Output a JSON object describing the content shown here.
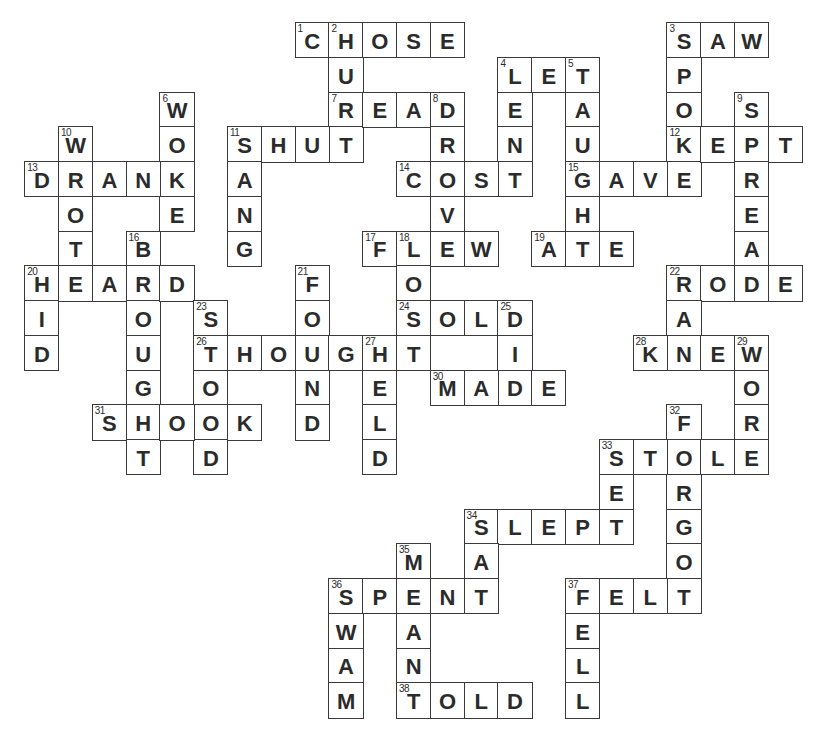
{
  "puzzle": {
    "title": "Irregular Past Tense Verbs Crossword",
    "grid": {
      "origin_x": 25,
      "origin_y": 23,
      "cell_w": 33.8,
      "cell_h": 34.75
    },
    "colors": {
      "border": "#3a3a3a",
      "text": "#2b2b2b",
      "background": "#ffffff"
    },
    "words": [
      {
        "num": 1,
        "dir": "across",
        "word": "CHOSE",
        "col": 8,
        "row": 0
      },
      {
        "num": 2,
        "dir": "down",
        "word": "HURT",
        "col": 9,
        "row": 0
      },
      {
        "num": 3,
        "dir": "across",
        "word": "SAW",
        "col": 19,
        "row": 0
      },
      {
        "num": 3,
        "dir": "down",
        "word": "SPOKE",
        "col": 19,
        "row": 0
      },
      {
        "num": 4,
        "dir": "across",
        "word": "LET",
        "col": 14,
        "row": 1
      },
      {
        "num": 4,
        "dir": "down",
        "word": "LENT",
        "col": 14,
        "row": 1
      },
      {
        "num": 5,
        "dir": "down",
        "word": "TAUGHT",
        "col": 16,
        "row": 1
      },
      {
        "num": 6,
        "dir": "down",
        "word": "WOKE",
        "col": 4,
        "row": 2
      },
      {
        "num": 7,
        "dir": "across",
        "word": "READ",
        "col": 9,
        "row": 2
      },
      {
        "num": 8,
        "dir": "down",
        "word": "DROVE",
        "col": 12,
        "row": 2
      },
      {
        "num": 9,
        "dir": "down",
        "word": "SPREAD",
        "col": 21,
        "row": 2
      },
      {
        "num": 10,
        "dir": "down",
        "word": "WROTE",
        "col": 1,
        "row": 3
      },
      {
        "num": 11,
        "dir": "across",
        "word": "SHUT",
        "col": 6,
        "row": 3
      },
      {
        "num": 11,
        "dir": "down",
        "word": "SANG",
        "col": 6,
        "row": 3
      },
      {
        "num": 12,
        "dir": "across",
        "word": "KEPT",
        "col": 19,
        "row": 3
      },
      {
        "num": 13,
        "dir": "across",
        "word": "DRANK",
        "col": 0,
        "row": 4
      },
      {
        "num": 14,
        "dir": "across",
        "word": "COST",
        "col": 11,
        "row": 4
      },
      {
        "num": 15,
        "dir": "across",
        "word": "GAVE",
        "col": 16,
        "row": 4
      },
      {
        "num": 16,
        "dir": "down",
        "word": "BROUGHT",
        "col": 3,
        "row": 6
      },
      {
        "num": 17,
        "dir": "across",
        "word": "FLEW",
        "col": 10,
        "row": 6
      },
      {
        "num": 18,
        "dir": "down",
        "word": "LOST",
        "col": 11,
        "row": 6
      },
      {
        "num": 19,
        "dir": "across",
        "word": "ATE",
        "col": 15,
        "row": 6
      },
      {
        "num": 20,
        "dir": "across",
        "word": "HEARD",
        "col": 0,
        "row": 7
      },
      {
        "num": 20,
        "dir": "down",
        "word": "HID",
        "col": 0,
        "row": 7
      },
      {
        "num": 21,
        "dir": "down",
        "word": "FOUND",
        "col": 8,
        "row": 7
      },
      {
        "num": 22,
        "dir": "across",
        "word": "RODE",
        "col": 19,
        "row": 7
      },
      {
        "num": 22,
        "dir": "down",
        "word": "RAN",
        "col": 19,
        "row": 7
      },
      {
        "num": 23,
        "dir": "down",
        "word": "STOOD",
        "col": 5,
        "row": 8
      },
      {
        "num": 24,
        "dir": "across",
        "word": "SOLD",
        "col": 11,
        "row": 8
      },
      {
        "num": 25,
        "dir": "down",
        "word": "DID",
        "col": 14,
        "row": 8
      },
      {
        "num": 26,
        "dir": "across",
        "word": "THOUGHT",
        "col": 5,
        "row": 9
      },
      {
        "num": 27,
        "dir": "down",
        "word": "HELD",
        "col": 10,
        "row": 9
      },
      {
        "num": 28,
        "dir": "across",
        "word": "KNEW",
        "col": 18,
        "row": 9
      },
      {
        "num": 29,
        "dir": "down",
        "word": "WORE",
        "col": 21,
        "row": 9
      },
      {
        "num": 30,
        "dir": "across",
        "word": "MADE",
        "col": 12,
        "row": 10
      },
      {
        "num": 31,
        "dir": "across",
        "word": "SHOOK",
        "col": 2,
        "row": 11
      },
      {
        "num": 32,
        "dir": "down",
        "word": "FORGOT",
        "col": 19,
        "row": 11
      },
      {
        "num": 33,
        "dir": "across",
        "word": "STOLE",
        "col": 17,
        "row": 12
      },
      {
        "num": 33,
        "dir": "down",
        "word": "SET",
        "col": 17,
        "row": 12
      },
      {
        "num": 34,
        "dir": "across",
        "word": "SLEPT",
        "col": 13,
        "row": 14
      },
      {
        "num": 34,
        "dir": "down",
        "word": "SAT",
        "col": 13,
        "row": 14
      },
      {
        "num": 35,
        "dir": "down",
        "word": "MEANT",
        "col": 11,
        "row": 15
      },
      {
        "num": 36,
        "dir": "across",
        "word": "SPENT",
        "col": 9,
        "row": 16
      },
      {
        "num": 36,
        "dir": "down",
        "word": "SWAM",
        "col": 9,
        "row": 16
      },
      {
        "num": 37,
        "dir": "across",
        "word": "FELT",
        "col": 16,
        "row": 16
      },
      {
        "num": 37,
        "dir": "down",
        "word": "FELL",
        "col": 16,
        "row": 16
      },
      {
        "num": 38,
        "dir": "across",
        "word": "TOLD",
        "col": 11,
        "row": 19
      }
    ]
  }
}
